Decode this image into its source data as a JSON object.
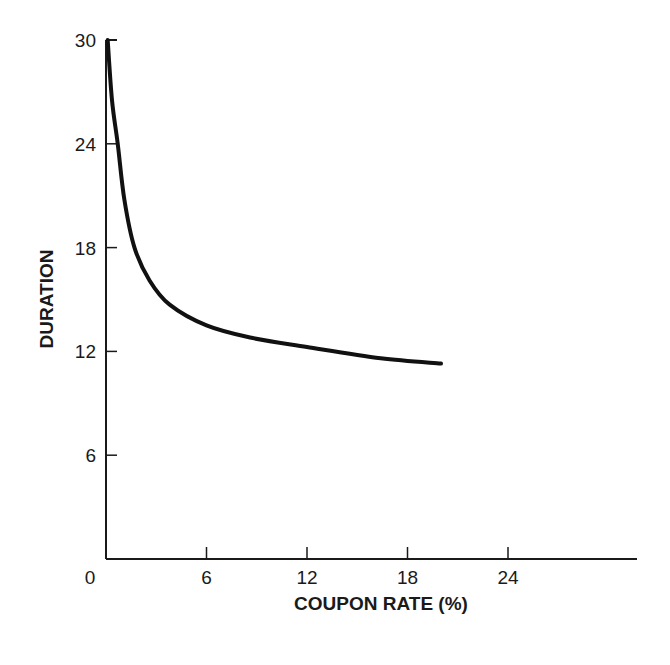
{
  "chart_data": {
    "type": "line",
    "title": "",
    "xlabel": "COUPON RATE (%)",
    "ylabel": "DURATION",
    "xlim": [
      0,
      30
    ],
    "ylim": [
      0,
      30
    ],
    "x_ticks": [
      0,
      6,
      12,
      18,
      24
    ],
    "y_ticks": [
      6,
      12,
      18,
      24,
      30
    ],
    "x_tick_labels": [
      "0",
      "6",
      "12",
      "18",
      "24"
    ],
    "y_tick_labels": [
      "6",
      "12",
      "18",
      "24",
      "30"
    ],
    "grid": false,
    "legend": null,
    "series": [
      {
        "name": "Duration vs Coupon Rate",
        "x": [
          0.1,
          0.36,
          0.7,
          1.1,
          1.7,
          2.6,
          3.8,
          6,
          8.6,
          12,
          16.4,
          20
        ],
        "y": [
          30,
          26.5,
          24,
          20.75,
          18,
          16.1,
          14.7,
          13.5,
          12.8,
          12.25,
          11.6,
          11.3
        ]
      }
    ]
  },
  "axes": {
    "origin_label": "0"
  }
}
